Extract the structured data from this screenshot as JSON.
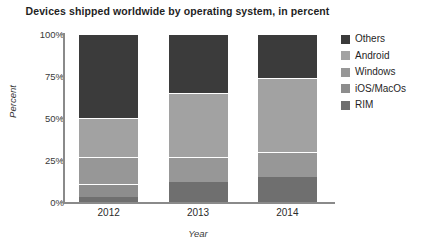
{
  "chart_data": {
    "type": "bar",
    "subtype": "stacked-bar-100-percent",
    "title": "Devices shipped worldwide by operating system, in percent",
    "xlabel": "Year",
    "ylabel": "Percent",
    "categories": [
      "2012",
      "2013",
      "2014"
    ],
    "ylim": [
      0,
      100
    ],
    "yticks": [
      0,
      25,
      50,
      75,
      100
    ],
    "ytick_labels": [
      "0%",
      "25%",
      "50%",
      "75%",
      "100%"
    ],
    "grid": false,
    "legend_position": "right",
    "stack_order_bottom_to_top": [
      "RIM",
      "iOS/MacOs",
      "Windows",
      "Android",
      "Others"
    ],
    "series": [
      {
        "name": "Others",
        "color": "#3b3b3b",
        "values": [
          50,
          35,
          26
        ]
      },
      {
        "name": "Android",
        "color": "#a2a2a2",
        "values": [
          23,
          38,
          44
        ]
      },
      {
        "name": "Windows",
        "color": "#979797",
        "values": [
          16,
          15,
          15
        ]
      },
      {
        "name": "iOS/MacOs",
        "color": "#8d8d8d",
        "values": [
          8,
          0,
          0
        ]
      },
      {
        "name": "RIM",
        "color": "#6f6f6f",
        "values": [
          3,
          12,
          15
        ]
      }
    ],
    "stacked_boundaries_percent": {
      "2012": {
        "RIM": [
          0,
          3
        ],
        "iOS/MacOs": [
          3,
          11
        ],
        "Windows": [
          11,
          27
        ],
        "Android": [
          27,
          50
        ],
        "Others": [
          50,
          100
        ]
      },
      "2013": {
        "RIM": [
          0,
          12
        ],
        "iOS/MacOs": [
          12,
          12
        ],
        "Windows": [
          12,
          27
        ],
        "Android": [
          27,
          65
        ],
        "Others": [
          65,
          100
        ]
      },
      "2014": {
        "RIM": [
          0,
          15
        ],
        "iOS/MacOs": [
          15,
          15
        ],
        "Windows": [
          15,
          30
        ],
        "Android": [
          30,
          74
        ],
        "Others": [
          74,
          100
        ]
      }
    }
  },
  "legend": {
    "items": [
      {
        "label": "Others",
        "color": "#3b3b3b"
      },
      {
        "label": "Android",
        "color": "#a2a2a2"
      },
      {
        "label": "Windows",
        "color": "#979797"
      },
      {
        "label": "iOS/MacOs",
        "color": "#8d8d8d"
      },
      {
        "label": "RIM",
        "color": "#6f6f6f"
      }
    ]
  }
}
